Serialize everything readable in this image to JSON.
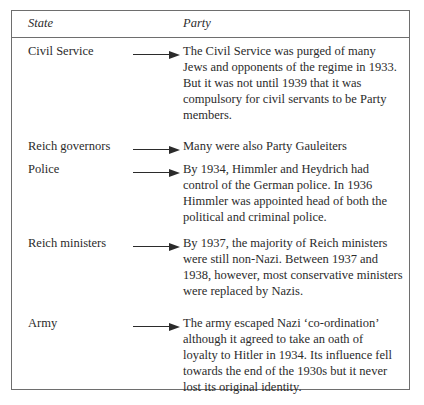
{
  "table": {
    "columns": [
      {
        "key": "state",
        "label": "State"
      },
      {
        "key": "party",
        "label": "Party"
      }
    ],
    "connector_icon": "right-arrow-icon",
    "rows": [
      {
        "state": "Civil Service",
        "party_lines": [
          "The Civil Service was purged of many",
          "Jews and opponents of the regime in 1933.",
          "But it was not until 1939 that it was",
          "compulsory for civil servants to be Party",
          "members."
        ]
      },
      {
        "state": "Reich governors",
        "party_lines": [
          "Many were also Party Gauleiters"
        ]
      },
      {
        "state": "Police",
        "party_lines": [
          "By 1934, Himmler and Heydrich had",
          "control of the German police. In 1936",
          "Himmler was appointed head of both the",
          "political and criminal police."
        ]
      },
      {
        "state": "Reich ministers",
        "party_lines": [
          "By 1937, the majority of Reich ministers",
          "were still non-Nazi. Between 1937 and",
          "1938, however, most conservative ministers",
          "were replaced by Nazis."
        ]
      },
      {
        "state": "Army",
        "party_lines": [
          "The army escaped Nazi ‘co-ordination’",
          "although it agreed to take an oath of",
          "loyalty to Hitler in 1934. Its influence fell",
          "towards the end of the 1930s but it never",
          "lost its original identity."
        ]
      }
    ],
    "row_offsets_px": [
      5,
      100,
      123,
      197,
      277
    ],
    "colors": {
      "border": "#6e6e6e",
      "text": "#2b2b2b",
      "background": "#ffffff"
    }
  }
}
